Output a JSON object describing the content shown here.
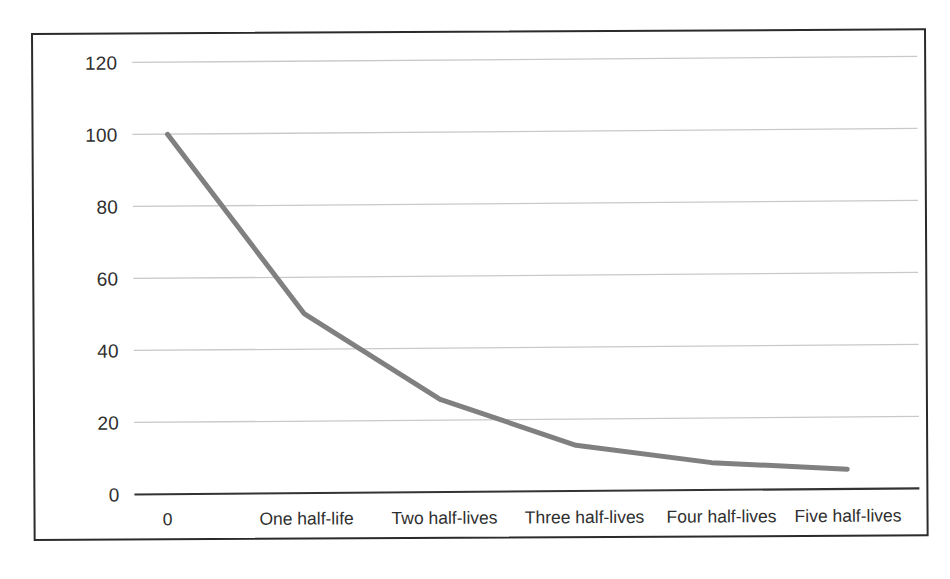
{
  "chart_data": {
    "type": "line",
    "title": "",
    "subtitle": "",
    "xlabel": "",
    "ylabel": "",
    "categories": [
      "0",
      "One half-life",
      "Two half-lives",
      "Three half-lives",
      "Four half-lives",
      "Five half-lives"
    ],
    "x": [
      0,
      1,
      2,
      3,
      4,
      5
    ],
    "values": [
      100,
      50,
      26,
      13,
      8,
      6
    ],
    "series": [
      {
        "name": "Amount remaining",
        "values": [
          100,
          50,
          26,
          13,
          8,
          6
        ],
        "color": "#808080"
      }
    ],
    "ylim": [
      0,
      120
    ],
    "yticks": [
      0,
      20,
      40,
      60,
      80,
      100,
      120
    ],
    "ytick_labels": [
      "0",
      "20",
      "40",
      "60",
      "80",
      "100",
      "120"
    ],
    "xtick_labels": [
      "0",
      "One half-life",
      "Two half-lives",
      "Three half-lives",
      "Four half-lives",
      "Five half-lives"
    ],
    "grid": true,
    "grid_axis": "y",
    "legend": false,
    "legend_position": "none",
    "annotations": []
  },
  "style": {
    "line_color": "#808080",
    "grid_color": "#c9c9c9",
    "axis_color": "#333333",
    "frame_color": "#2b2b2b",
    "text_color": "#2f2f2f",
    "background": "#ffffff",
    "line_width": "5"
  },
  "axis": {
    "y_labels": [
      {
        "value": "120",
        "y": 28
      },
      {
        "value": "100",
        "y": 100
      },
      {
        "value": "80",
        "y": 172
      },
      {
        "value": "60",
        "y": 244
      },
      {
        "value": "40",
        "y": 316
      },
      {
        "value": "20",
        "y": 388
      },
      {
        "value": "0",
        "y": 460
      }
    ],
    "x_labels": [
      {
        "value": "0",
        "x": 132
      },
      {
        "value": "One half-life",
        "x": 271
      },
      {
        "value": "Two half-lives",
        "x": 409
      },
      {
        "value": "Three half-lives",
        "x": 548
      },
      {
        "value": "Four half-lives",
        "x": 686
      },
      {
        "value": "Five half-lives",
        "x": 812
      }
    ]
  }
}
